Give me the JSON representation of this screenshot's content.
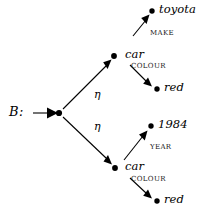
{
  "figure": {
    "type": "directed-graph",
    "root_label": "B:",
    "nodes": [
      {
        "id": "root",
        "label": "",
        "x": 59,
        "y": 113
      },
      {
        "id": "car_top",
        "label": "car",
        "x": 114,
        "y": 56
      },
      {
        "id": "toyota",
        "label": "toyota",
        "x": 152,
        "y": 11
      },
      {
        "id": "red_top",
        "label": "red",
        "x": 157,
        "y": 89
      },
      {
        "id": "car_bottom",
        "label": "car",
        "x": 115,
        "y": 168
      },
      {
        "id": "year1984",
        "label": "1984",
        "x": 151,
        "y": 126
      },
      {
        "id": "red_bottom",
        "label": "red",
        "x": 157,
        "y": 201
      }
    ],
    "edges": [
      {
        "from": "root",
        "to": "car_top",
        "label": "η"
      },
      {
        "from": "root",
        "to": "car_bottom",
        "label": "η"
      },
      {
        "from": "car_top",
        "to": "toyota",
        "label": "MAKE"
      },
      {
        "from": "car_top",
        "to": "red_top",
        "label": "COLOUR"
      },
      {
        "from": "car_bottom",
        "to": "year1984",
        "label": "YEAR"
      },
      {
        "from": "car_bottom",
        "to": "red_bottom",
        "label": "COLOUR"
      }
    ],
    "labels": {
      "root": "B:",
      "car_top": "car",
      "toyota": "toyota",
      "red_top": "red",
      "car_bottom": "car",
      "year1984": "1984",
      "red_bottom": "red",
      "eta_top": "η",
      "eta_bottom": "η",
      "make": "MAKE",
      "colour_top": "COLOUR",
      "year": "YEAR",
      "colour_bottom": "COLOUR"
    },
    "colors": {
      "stroke": "#000000",
      "node_fill": "#000000",
      "text": "#000000",
      "background": "#ffffff"
    }
  }
}
